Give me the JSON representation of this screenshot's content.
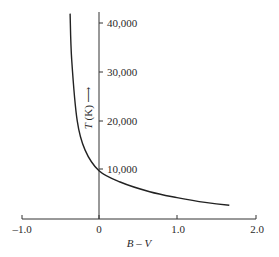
{
  "chart_data": {
    "type": "line",
    "title": "",
    "xlabel": "B – V",
    "ylabel": "T (K) ⟶",
    "xlim": [
      -1.0,
      2.0
    ],
    "ylim": [
      0,
      42000
    ],
    "grid": false,
    "legend": null,
    "x_ticks": [
      -1.0,
      0,
      1.0,
      2.0
    ],
    "x_tick_labels": [
      "–1.0",
      "0",
      "1.0",
      "2.0"
    ],
    "y_ticks": [
      10000,
      20000,
      30000,
      40000
    ],
    "y_tick_labels": [
      "10,000",
      "20,000",
      "30,000",
      "40,000"
    ],
    "series": [
      {
        "name": "Temperature vs color index",
        "x": [
          -0.37,
          -0.35,
          -0.28,
          -0.18,
          0.0,
          0.27,
          0.65,
          1.0,
          1.36,
          1.67
        ],
        "y": [
          42000,
          32500,
          20000,
          14000,
          9700,
          7400,
          5400,
          4200,
          3200,
          2600
        ]
      }
    ]
  },
  "labels": {
    "x_axis_title": "B – V",
    "y_axis_title_var": "T",
    "y_axis_title_unit": " (K) ",
    "y_axis_arrow": "⟶"
  }
}
